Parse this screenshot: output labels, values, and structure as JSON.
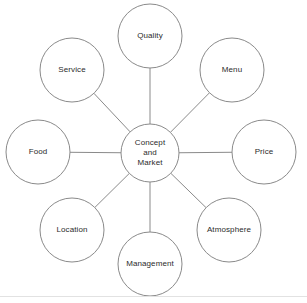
{
  "diagram": {
    "type": "hub-and-spoke",
    "title": "",
    "background_color": "#ffffff",
    "stroke_color": "#8a8a8a",
    "text_color": "#2b2b2b",
    "center": {
      "label": "Concept and Market",
      "lines": [
        "Concept",
        "and",
        "Market"
      ],
      "cx": 150,
      "cy": 153,
      "r": 29
    },
    "satellite_radius": 32,
    "ring_radius": 117,
    "nodes": [
      {
        "id": "quality",
        "label": "Quality",
        "cx": 150,
        "cy": 36,
        "r": 32,
        "angle_deg": 90
      },
      {
        "id": "menu",
        "label": "Menu",
        "cx": 232,
        "cy": 70,
        "r": 32,
        "angle_deg": 45
      },
      {
        "id": "price",
        "label": "Price",
        "cx": 264,
        "cy": 152,
        "r": 32,
        "angle_deg": 0
      },
      {
        "id": "atmosphere",
        "label": "Atmosphere",
        "cx": 229,
        "cy": 230,
        "r": 32,
        "angle_deg": 315
      },
      {
        "id": "management",
        "label": "Management",
        "cx": 150,
        "cy": 264,
        "r": 32,
        "angle_deg": 270
      },
      {
        "id": "location",
        "label": "Location",
        "cx": 72,
        "cy": 230,
        "r": 32,
        "angle_deg": 225
      },
      {
        "id": "food",
        "label": "Food",
        "cx": 38,
        "cy": 152,
        "r": 32,
        "angle_deg": 180
      },
      {
        "id": "service",
        "label": "Service",
        "cx": 72,
        "cy": 70,
        "r": 32,
        "angle_deg": 135
      }
    ],
    "footer_rule": {
      "y": 296,
      "color": "#e2e2e2"
    }
  }
}
